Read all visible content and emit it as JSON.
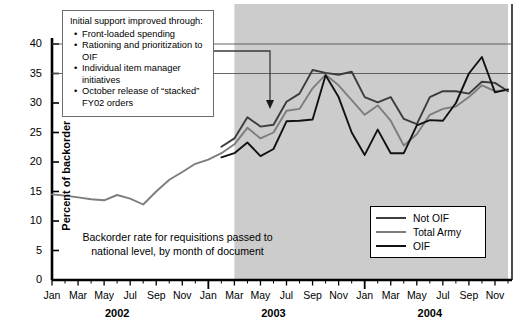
{
  "chart_data": {
    "type": "line",
    "title": "",
    "caption": "Backorder rate for requisitions passed to national level, by month of document",
    "ylabel": "Percent of backorder rate",
    "xlabel": "",
    "ylim": [
      0,
      40
    ],
    "yticks": [
      0,
      5,
      10,
      15,
      20,
      25,
      30,
      35,
      40
    ],
    "grid": false,
    "legend_position": "bottom-right",
    "x": [
      "Jan 2002",
      "Feb 2002",
      "Mar 2002",
      "Apr 2002",
      "May 2002",
      "Jun 2002",
      "Jul 2002",
      "Aug 2002",
      "Sep 2002",
      "Oct 2002",
      "Nov 2002",
      "Dec 2002",
      "Jan 2003",
      "Feb 2003",
      "Mar 2003",
      "Apr 2003",
      "May 2003",
      "Jun 2003",
      "Jul 2003",
      "Aug 2003",
      "Sep 2003",
      "Oct 2003",
      "Nov 2003",
      "Dec 2003",
      "Jan 2004",
      "Feb 2004",
      "Mar 2004",
      "Apr 2004",
      "May 2004",
      "Jun 2004",
      "Jul 2004",
      "Aug 2004",
      "Sep 2004",
      "Oct 2004",
      "Nov 2004",
      "Dec 2004"
    ],
    "xtick_labels": [
      "Jan",
      "Mar",
      "May",
      "Jul",
      "Sep",
      "Nov",
      "Jan",
      "Mar",
      "May",
      "Jul",
      "Sep",
      "Nov",
      "Jan",
      "Mar",
      "May",
      "Jul",
      "Sep",
      "Nov"
    ],
    "year_labels": [
      "2002",
      "2003",
      "2004"
    ],
    "series": [
      {
        "name": "Not OIF",
        "color": "#3c3c3c",
        "values": [
          null,
          null,
          null,
          null,
          null,
          null,
          null,
          null,
          null,
          null,
          null,
          null,
          null,
          22.6,
          24.0,
          27.6,
          26.0,
          26.3,
          30.2,
          31.6,
          35.6,
          35.1,
          34.8,
          35.3,
          31.0,
          30.1,
          31.0,
          27.3,
          26.4,
          31.0,
          32.0,
          32.0,
          31.6,
          33.6,
          33.4,
          32.0
        ]
      },
      {
        "name": "Total Army",
        "color": "#7d7d7d",
        "values": [
          14.5,
          14.3,
          14.0,
          13.7,
          13.5,
          14.4,
          13.8,
          12.8,
          15.0,
          17.0,
          18.3,
          19.7,
          20.4,
          21.5,
          23.0,
          25.8,
          24.0,
          25.0,
          28.7,
          29.0,
          32.5,
          34.8,
          33.0,
          30.5,
          28.0,
          29.6,
          27.0,
          22.8,
          24.7,
          28.0,
          29.0,
          29.4,
          31.0,
          33.0,
          32.0,
          32.2
        ]
      },
      {
        "name": "OIF",
        "color": "#121212",
        "values": [
          null,
          null,
          null,
          null,
          null,
          null,
          null,
          null,
          null,
          null,
          null,
          null,
          null,
          20.8,
          21.5,
          23.3,
          21.0,
          22.2,
          26.9,
          27.0,
          27.2,
          34.7,
          31.0,
          25.0,
          21.2,
          25.5,
          21.5,
          21.5,
          26.2,
          27.1,
          27.0,
          30.0,
          35.0,
          37.8,
          31.8,
          32.3
        ]
      }
    ],
    "shaded_region": {
      "label": "OIF period",
      "start_index": 14,
      "color": "#cccccc"
    },
    "annotation": {
      "heading": "Initial support improved through:",
      "bullets": [
        "Front-loaded spending",
        "Rationing and prioritization to OIF",
        "Individual item manager initiatives",
        "October release of “stacked” FY02 orders"
      ]
    }
  }
}
